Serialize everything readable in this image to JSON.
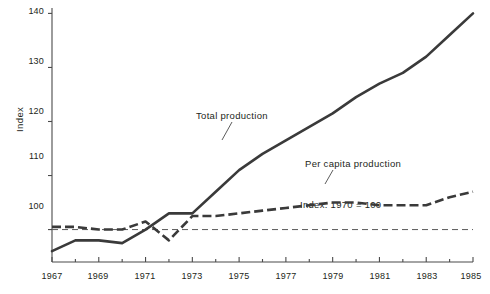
{
  "chart_data": {
    "type": "line",
    "title": "",
    "xlabel": "",
    "ylabel": "Index",
    "xlim": [
      1967,
      1985
    ],
    "ylim": [
      94,
      141
    ],
    "yticks": [
      100,
      110,
      120,
      130,
      140
    ],
    "ytick_labels": [
      "100",
      "110",
      "120",
      "130",
      "140"
    ],
    "xticks": [
      1967,
      1969,
      1971,
      1973,
      1975,
      1977,
      1979,
      1981,
      1983,
      1985
    ],
    "xtick_labels": [
      "1967",
      "1969",
      "1971",
      "1973",
      "1975",
      "1977",
      "1979",
      "1981",
      "1983",
      "1985"
    ],
    "minor_xticks": [
      1968,
      1970,
      1972,
      1974,
      1976,
      1978,
      1980,
      1982,
      1984
    ],
    "grid": false,
    "legend_position": "inline-annotation",
    "x": [
      1967,
      1968,
      1969,
      1970,
      1971,
      1972,
      1973,
      1974,
      1975,
      1976,
      1977,
      1978,
      1979,
      1980,
      1981,
      1982,
      1983,
      1984,
      1985
    ],
    "series": [
      {
        "name": "Total production",
        "style": "solid",
        "color": "#3a3a3a",
        "values": [
          96.0,
          98.0,
          98.0,
          97.5,
          100.0,
          103.0,
          103.0,
          107.0,
          111.0,
          114.0,
          116.5,
          119.0,
          121.5,
          124.5,
          127.0,
          129.0,
          132.0,
          136.0,
          140.0
        ]
      },
      {
        "name": "Per capita production",
        "style": "dashed",
        "color": "#3a3a3a",
        "values": [
          100.5,
          100.5,
          100.0,
          100.0,
          101.5,
          98.0,
          102.5,
          102.5,
          103.0,
          103.5,
          104.0,
          104.5,
          105.0,
          105.0,
          104.5,
          104.5,
          104.5,
          106.0,
          107.0
        ]
      }
    ],
    "reference_line": {
      "label": "Index: 1970 = 100",
      "value": 100,
      "style": "dashed"
    },
    "annotations": [
      {
        "name": "total-production-annotation",
        "text": "Total production",
        "anchor_x": 1975,
        "anchor_y": 111
      },
      {
        "name": "per-capita-production-annotation",
        "text": "Per capita production",
        "anchor_x": 1979,
        "anchor_y": 105
      }
    ]
  },
  "axis": {
    "ylabel": "Index"
  }
}
